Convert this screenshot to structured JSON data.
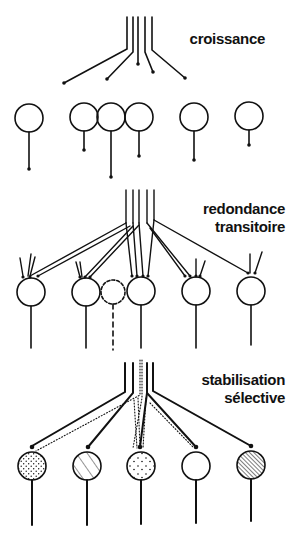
{
  "panels": [
    {
      "id": "growth",
      "label_lines": [
        "croissance"
      ]
    },
    {
      "id": "redundancy",
      "label_lines": [
        "redondance",
        "transitoire"
      ]
    },
    {
      "id": "stabilization",
      "label_lines": [
        "stabilisation",
        "sélective"
      ]
    }
  ],
  "colors": {
    "ink": "#111111",
    "background": "#ffffff"
  }
}
